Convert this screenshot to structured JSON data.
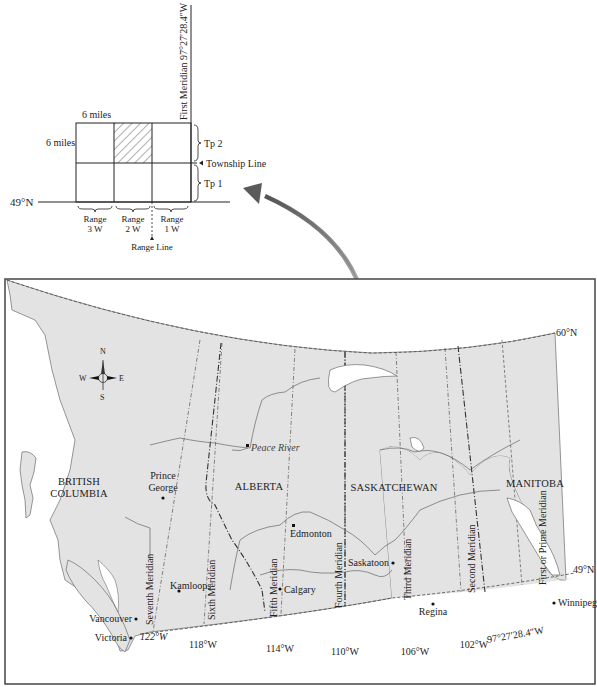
{
  "inset": {
    "title": "Township and Range Grid",
    "first_meridian_label": "First Meridian 97°27′28.4″W",
    "width_label": "6 miles",
    "height_label": "6 miles",
    "parallel_label": "49°N",
    "township_line_label": "Township Line",
    "range_line_label": "Range Line",
    "townships": [
      {
        "label": "Tp 2"
      },
      {
        "label": "Tp 1"
      }
    ],
    "ranges": [
      {
        "line1": "Range",
        "line2": "3 W"
      },
      {
        "line1": "Range",
        "line2": "2 W"
      },
      {
        "line1": "Range",
        "line2": "1 W"
      }
    ],
    "highlighted_cell": {
      "range": "2 W",
      "township": "Tp 2",
      "pattern": "hatched"
    }
  },
  "map": {
    "north_parallel_label": "60°N",
    "south_parallel_label": "49°N",
    "compass": {
      "n": "N",
      "s": "S",
      "e": "E",
      "w": "W"
    },
    "provinces": [
      {
        "line1": "BRITISH",
        "line2": "COLUMBIA"
      },
      {
        "line1": "ALBERTA"
      },
      {
        "line1": "SASKATCHEWAN"
      },
      {
        "line1": "MANITOBA"
      }
    ],
    "meridians": [
      {
        "name": "Seventh Meridian",
        "longitude": "122°W"
      },
      {
        "name": "Sixth Meridian",
        "longitude": "118°W"
      },
      {
        "name": "Fifth Meridian",
        "longitude": "114°W"
      },
      {
        "name": "Fourth Meridian",
        "longitude": "110°W"
      },
      {
        "name": "Third Meridian",
        "longitude": "106°W"
      },
      {
        "name": "Second Meridian",
        "longitude": "102°W"
      },
      {
        "name": "First or Prime Meridian",
        "longitude": "97°27′28.4″W"
      }
    ],
    "cities": [
      {
        "name": "Peace River"
      },
      {
        "name": "Prince",
        "name2": "George"
      },
      {
        "name": "Edmonton"
      },
      {
        "name": "Saskatoon"
      },
      {
        "name": "Kamloops"
      },
      {
        "name": "Calgary"
      },
      {
        "name": "Vancouver"
      },
      {
        "name": "Victoria"
      },
      {
        "name": "Regina"
      },
      {
        "name": "Winnipeg"
      }
    ],
    "colors": {
      "land": "#e4e4e4",
      "water": "#ffffff",
      "frame": "#444444",
      "arrow": "#6b6b6b"
    }
  }
}
